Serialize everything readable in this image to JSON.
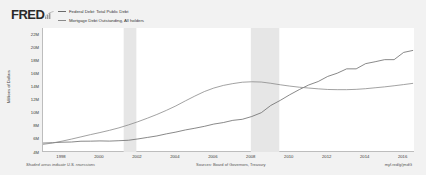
{
  "header": {
    "logo_text": "FRED",
    "logo_mark_icon": "fred-chart-mark-icon"
  },
  "legend": {
    "items": [
      {
        "label": "Federal Debt: Total Public Debt",
        "color": "#6b6b6b",
        "icon": "line-swatch-icon"
      },
      {
        "label": "Mortgage Debt Outstanding, All holders",
        "color": "#8a8a8a",
        "icon": "line-swatch-icon"
      }
    ]
  },
  "footer": {
    "recession_note": "Shaded areas indicate U.S. recessions",
    "sources": "Sources: Board of Governors, Treasury",
    "short_url": "myf.red/g/jmdG"
  },
  "chart_data": {
    "type": "line",
    "title": "",
    "xlabel": "",
    "ylabel": "Millions of Dollars",
    "xlim": [
      1997.0,
      2016.6
    ],
    "ylim": [
      4000000,
      23000000
    ],
    "ytick_labels": [
      "22M",
      "20M",
      "18M",
      "16M",
      "14M",
      "12M",
      "10M",
      "8M",
      "6M",
      "4M"
    ],
    "ytick_values": [
      22000000,
      20000000,
      18000000,
      16000000,
      14000000,
      12000000,
      10000000,
      8000000,
      6000000,
      4000000
    ],
    "xtick_labels": [
      "1998",
      "2000",
      "2002",
      "2004",
      "2006",
      "2008",
      "2010",
      "2012",
      "2014",
      "2016"
    ],
    "xtick_values": [
      1998,
      2000,
      2002,
      2004,
      2006,
      2008,
      2010,
      2012,
      2014,
      2016
    ],
    "grid": false,
    "legend_position": "top",
    "recessions": [
      {
        "start": 2001.25,
        "end": 2001.92
      },
      {
        "start": 2007.95,
        "end": 2009.45
      }
    ],
    "recession_color": "#e6e6e6",
    "series": [
      {
        "name": "Federal Debt: Total Public Debt",
        "color": "#6b6b6b",
        "x": [
          1997.0,
          1997.5,
          1998.0,
          1998.5,
          1999.0,
          1999.5,
          2000.0,
          2000.5,
          2001.0,
          2001.5,
          2002.0,
          2002.5,
          2003.0,
          2003.5,
          2004.0,
          2004.5,
          2005.0,
          2005.5,
          2006.0,
          2006.5,
          2007.0,
          2007.5,
          2008.0,
          2008.5,
          2009.0,
          2009.5,
          2010.0,
          2010.5,
          2011.0,
          2011.5,
          2012.0,
          2012.5,
          2013.0,
          2013.5,
          2014.0,
          2014.5,
          2015.0,
          2015.5,
          2016.0,
          2016.5
        ],
        "y": [
          5370000,
          5420000,
          5500000,
          5530000,
          5650000,
          5660000,
          5700000,
          5670000,
          5730000,
          5800000,
          6000000,
          6230000,
          6460000,
          6780000,
          7050000,
          7380000,
          7640000,
          7930000,
          8280000,
          8510000,
          8850000,
          9010000,
          9440000,
          10020000,
          11130000,
          11910000,
          12770000,
          13560000,
          14270000,
          14800000,
          15580000,
          16070000,
          16740000,
          16740000,
          17540000,
          17830000,
          18150000,
          18150000,
          19260000,
          19570000
        ]
      },
      {
        "name": "Mortgage Debt Outstanding, All holders",
        "color": "#8a8a8a",
        "x": [
          1997.0,
          1997.5,
          1998.0,
          1998.5,
          1999.0,
          1999.5,
          2000.0,
          2000.5,
          2001.0,
          2001.5,
          2002.0,
          2002.5,
          2003.0,
          2003.5,
          2004.0,
          2004.5,
          2005.0,
          2005.5,
          2006.0,
          2006.5,
          2007.0,
          2007.5,
          2008.0,
          2008.5,
          2009.0,
          2009.5,
          2010.0,
          2010.5,
          2011.0,
          2011.5,
          2012.0,
          2012.5,
          2013.0,
          2013.5,
          2014.0,
          2014.5,
          2015.0,
          2015.5,
          2016.0,
          2016.5
        ],
        "y": [
          5170000,
          5380000,
          5660000,
          5980000,
          6320000,
          6660000,
          6980000,
          7320000,
          7700000,
          8150000,
          8640000,
          9180000,
          9750000,
          10380000,
          11060000,
          11830000,
          12570000,
          13260000,
          13800000,
          14200000,
          14480000,
          14690000,
          14760000,
          14720000,
          14530000,
          14300000,
          14100000,
          13930000,
          13800000,
          13680000,
          13580000,
          13550000,
          13550000,
          13600000,
          13700000,
          13840000,
          13980000,
          14150000,
          14330000,
          14520000
        ]
      }
    ]
  }
}
